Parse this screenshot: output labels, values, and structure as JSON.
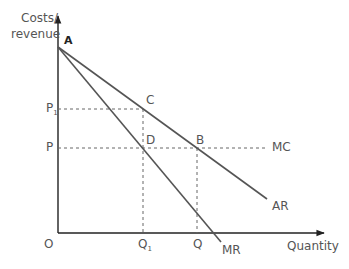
{
  "diagram": {
    "type": "monopoly-pricing",
    "axes": {
      "y_label_line1": "Costs/",
      "y_label_line2": "revenue",
      "x_label": "Quantity",
      "origin": "O"
    },
    "points": {
      "A": "A",
      "B": "B",
      "C": "C",
      "D": "D"
    },
    "y_ticks": {
      "p1": "P",
      "p1_sub": "1",
      "p": "P"
    },
    "x_ticks": {
      "q1": "Q",
      "q1_sub": "1",
      "q": "Q"
    },
    "curves": {
      "mc": "MC",
      "ar": "AR",
      "mr": "MR"
    },
    "colors": {
      "axis": "#222222",
      "line": "#555555",
      "dashed": "#666666",
      "label": "#555555"
    }
  }
}
